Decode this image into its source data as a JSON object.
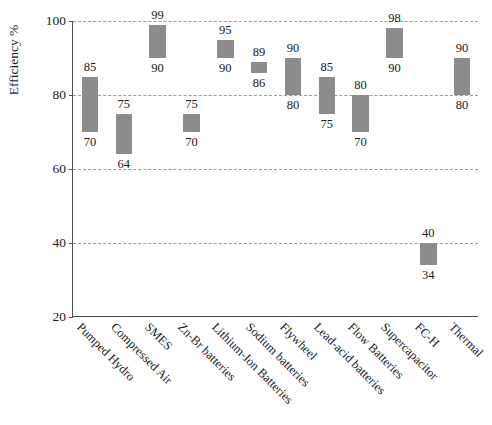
{
  "chart_data": {
    "type": "bar",
    "title": "",
    "subtitle": "",
    "xlabel": "",
    "ylabel": "Efficiency %",
    "ylim": [
      20,
      100
    ],
    "yticks": [
      20,
      40,
      60,
      80,
      100
    ],
    "grid": true,
    "gridlines_at": [
      40,
      60,
      80,
      100
    ],
    "legend": "none",
    "bar_color": "#8c8c8c",
    "note": "Floating (range) bar chart: each bar spans a minimum-to-maximum efficiency range; the upper number is the max and the lower number is the min.",
    "categories": [
      "Pumped Hydro",
      "Compressed Air",
      "SMES",
      "Zn-Br batteries",
      "Lithium-Ion Batteries",
      "Sodium batteries",
      "Flywheel",
      "Lead-acid batteries",
      "Flow Batteries",
      "Supercapacitor",
      "FC-H",
      "Thermal"
    ],
    "series": [
      {
        "name": "Efficiency range",
        "low": [
          70,
          64,
          90,
          70,
          90,
          86,
          80,
          75,
          70,
          90,
          34,
          80
        ],
        "high": [
          85,
          75,
          99,
          75,
          95,
          89,
          90,
          85,
          80,
          98,
          40,
          90
        ]
      }
    ],
    "bars": [
      {
        "category": "Pumped Hydro",
        "min": 70,
        "max": 85
      },
      {
        "category": "Compressed Air",
        "min": 64,
        "max": 75
      },
      {
        "category": "SMES",
        "min": 90,
        "max": 99
      },
      {
        "category": "Zn-Br batteries",
        "min": 70,
        "max": 75
      },
      {
        "category": "Lithium-Ion Batteries",
        "min": 90,
        "max": 95
      },
      {
        "category": "Sodium batteries",
        "min": 86,
        "max": 89
      },
      {
        "category": "Flywheel",
        "min": 80,
        "max": 90
      },
      {
        "category": "Lead-acid batteries",
        "min": 75,
        "max": 85
      },
      {
        "category": "Flow Batteries",
        "min": 70,
        "max": 80
      },
      {
        "category": "Supercapacitor",
        "min": 90,
        "max": 98
      },
      {
        "category": "FC-H",
        "min": 34,
        "max": 40
      },
      {
        "category": "Thermal",
        "min": 80,
        "max": 90
      }
    ]
  }
}
